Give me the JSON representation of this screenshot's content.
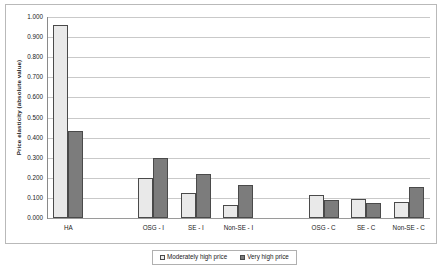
{
  "chart_data": {
    "type": "bar",
    "title": "",
    "subtitle": "",
    "xlabel": "",
    "ylabel": "Price elasticity (absolute value)",
    "ylim": [
      0.0,
      1.0
    ],
    "ytick_labels": [
      "1.000",
      "0.900",
      "0.800",
      "0.700",
      "0.600",
      "0.500",
      "0.400",
      "0.300",
      "0.200",
      "0.100",
      "0.000"
    ],
    "ytick_values": [
      1.0,
      0.9,
      0.8,
      0.7,
      0.6,
      0.5,
      0.4,
      0.3,
      0.2,
      0.1,
      0.0
    ],
    "grid": true,
    "legend_position": "bottom",
    "categories": [
      "HA",
      "",
      "OSG - I",
      "SE - I",
      "Non-SE - I",
      "",
      "OSG - C",
      "SE - C",
      "Non-SE - C"
    ],
    "series": [
      {
        "name": "Moderately high price",
        "color": "#e9e9e9",
        "values": [
          0.962,
          null,
          0.2,
          0.125,
          0.063,
          null,
          0.115,
          0.093,
          0.078
        ]
      },
      {
        "name": "Very high price",
        "color": "#7c7c7c",
        "values": [
          0.435,
          null,
          0.298,
          0.218,
          0.163,
          null,
          0.092,
          0.075,
          0.155
        ]
      }
    ]
  },
  "legend": {
    "entries": [
      {
        "label": "Moderately high price",
        "swatch": "light-gray-swatch-icon"
      },
      {
        "label": "Very high price",
        "swatch": "dark-gray-swatch-icon"
      }
    ]
  }
}
